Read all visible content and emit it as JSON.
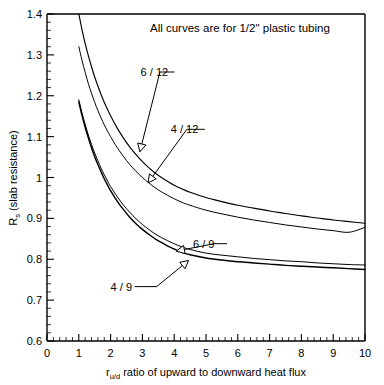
{
  "chart_data": {
    "type": "line",
    "title": "",
    "note": "All curves are for 1/2\" plastic tubing",
    "xlabel_prefix": "r",
    "xlabel_subscript": "u/d",
    "xlabel_rest": " ratio of upward to downward heat flux",
    "ylabel_prefix": "R",
    "ylabel_subscript": "s",
    "ylabel_rest": " (slab resistance)",
    "xlim": [
      0,
      10
    ],
    "ylim": [
      0.6,
      1.4
    ],
    "xticks": [
      0,
      1,
      2,
      3,
      4,
      5,
      6,
      7,
      8,
      9,
      10
    ],
    "xtick_labels": [
      "0",
      "1",
      "2",
      "3",
      "4",
      "5",
      "6",
      "7",
      "8",
      "9",
      "10"
    ],
    "x_minor_step": 0.2,
    "yticks": [
      0.6,
      0.7,
      0.8,
      0.9,
      1.0,
      1.1,
      1.2,
      1.3,
      1.4
    ],
    "ytick_labels": [
      "0.6",
      "0.7",
      "0.8",
      "0.9",
      "1",
      "1.1",
      "1.2",
      "1.3",
      "1.4"
    ],
    "y_minor_step": 0.02,
    "grid": false,
    "legend_position": "inline-callouts",
    "series": [
      {
        "name": "6 / 12",
        "label": "6 / 12",
        "x": [
          1.0,
          1.1,
          1.2,
          1.3,
          1.4,
          1.5,
          1.6,
          1.7,
          1.8,
          1.9,
          2.0,
          2.2,
          2.4,
          2.6,
          2.8,
          3.0,
          3.2,
          3.4,
          3.6,
          3.8,
          4.0,
          4.25,
          4.5,
          5.0,
          5.5,
          6.0,
          6.5,
          7.0,
          7.5,
          8.0,
          8.5,
          9.0,
          9.5,
          10.0
        ],
        "y": [
          1.4,
          1.362,
          1.328,
          1.298,
          1.271,
          1.246,
          1.224,
          1.203,
          1.184,
          1.167,
          1.151,
          1.122,
          1.097,
          1.075,
          1.056,
          1.039,
          1.024,
          1.011,
          1.0,
          0.99,
          0.981,
          0.972,
          0.964,
          0.951,
          0.941,
          0.932,
          0.925,
          0.918,
          0.912,
          0.906,
          0.901,
          0.896,
          0.892,
          0.888
        ]
      },
      {
        "name": "4 / 12",
        "label": "4 / 12",
        "x": [
          1.0,
          1.1,
          1.2,
          1.3,
          1.4,
          1.5,
          1.6,
          1.7,
          1.8,
          1.9,
          2.0,
          2.2,
          2.4,
          2.6,
          2.8,
          3.0,
          3.2,
          3.4,
          3.6,
          3.8,
          4.0,
          4.25,
          4.5,
          5.0,
          5.5,
          6.0,
          6.5,
          7.0,
          7.5,
          8.0,
          8.5,
          9.0,
          9.5,
          10.0
        ],
        "y": [
          1.32,
          1.287,
          1.257,
          1.23,
          1.206,
          1.184,
          1.164,
          1.146,
          1.129,
          1.114,
          1.1,
          1.074,
          1.052,
          1.032,
          1.015,
          1.0,
          0.987,
          0.975,
          0.965,
          0.956,
          0.948,
          0.939,
          0.932,
          0.92,
          0.911,
          0.903,
          0.896,
          0.89,
          0.884,
          0.879,
          0.874,
          0.87,
          0.866,
          0.878
        ]
      },
      {
        "name": "6 / 9",
        "label": "6 / 9",
        "x": [
          1.0,
          1.1,
          1.2,
          1.3,
          1.4,
          1.5,
          1.6,
          1.7,
          1.8,
          1.9,
          2.0,
          2.2,
          2.4,
          2.6,
          2.8,
          3.0,
          3.2,
          3.4,
          3.6,
          3.8,
          4.0,
          4.25,
          4.5,
          5.0,
          5.5,
          6.0,
          6.5,
          7.0,
          7.5,
          8.0,
          8.5,
          9.0,
          9.5,
          10.0
        ],
        "y": [
          1.19,
          1.158,
          1.13,
          1.104,
          1.081,
          1.06,
          1.041,
          1.023,
          1.007,
          0.992,
          0.978,
          0.954,
          0.933,
          0.915,
          0.899,
          0.885,
          0.873,
          0.862,
          0.853,
          0.845,
          0.838,
          0.83,
          0.824,
          0.815,
          0.81,
          0.806,
          0.802,
          0.799,
          0.796,
          0.794,
          0.791,
          0.789,
          0.787,
          0.786
        ]
      },
      {
        "name": "4 / 9",
        "label": "4 / 9",
        "x": [
          1.0,
          1.1,
          1.2,
          1.3,
          1.4,
          1.5,
          1.6,
          1.7,
          1.8,
          1.9,
          2.0,
          2.2,
          2.4,
          2.6,
          2.8,
          3.0,
          3.2,
          3.4,
          3.6,
          3.8,
          4.0,
          4.25,
          4.5,
          5.0,
          5.5,
          6.0,
          6.5,
          7.0,
          7.5,
          8.0,
          8.5,
          9.0,
          9.5,
          10.0
        ],
        "y": [
          1.185,
          1.152,
          1.123,
          1.097,
          1.073,
          1.051,
          1.032,
          1.014,
          0.997,
          0.982,
          0.968,
          0.943,
          0.922,
          0.903,
          0.887,
          0.873,
          0.861,
          0.85,
          0.841,
          0.832,
          0.825,
          0.817,
          0.811,
          0.803,
          0.798,
          0.794,
          0.791,
          0.788,
          0.785,
          0.783,
          0.781,
          0.779,
          0.777,
          0.775
        ]
      }
    ],
    "annotations": [
      {
        "label": "6 / 12",
        "text_x": 4.2,
        "text_y": 1.258,
        "elbow_x": 3.55,
        "elbow_y": 1.258,
        "tip_x": 2.92,
        "tip_y": 1.063
      },
      {
        "label": "4 / 12",
        "text_x": 5.15,
        "text_y": 1.118,
        "elbow_x": 4.4,
        "elbow_y": 1.118,
        "tip_x": 3.18,
        "tip_y": 0.987
      },
      {
        "label": "6 / 9",
        "text_x": 5.85,
        "text_y": 0.838,
        "elbow_x": 5.25,
        "elbow_y": 0.838,
        "tip_x": 4.07,
        "tip_y": 0.82
      },
      {
        "label": "4 / 9",
        "text_x": 2.0,
        "text_y": 0.733,
        "elbow_x": 3.45,
        "elbow_y": 0.733,
        "tip_x": 4.45,
        "tip_y": 0.797
      }
    ]
  }
}
